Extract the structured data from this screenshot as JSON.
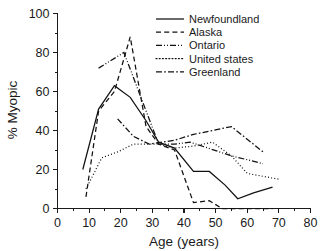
{
  "chart_data": {
    "type": "line",
    "title": "",
    "xlabel": "Age (years)",
    "ylabel": "% Myopic",
    "xlim": [
      0,
      80
    ],
    "ylim": [
      0,
      100
    ],
    "xticks": [
      0,
      10,
      20,
      30,
      40,
      50,
      60,
      70,
      80
    ],
    "yticks": [
      0,
      20,
      40,
      60,
      80,
      100
    ],
    "xticks_minor": [
      5,
      15,
      25,
      35,
      45,
      55,
      65,
      75
    ],
    "yticks_minor": [
      10,
      30,
      50,
      70,
      90
    ],
    "grid": false,
    "legend_position": "top-right",
    "series": [
      {
        "name": "Newfoundland",
        "style": "solid",
        "x": [
          8,
          13,
          18,
          23,
          28,
          32,
          37,
          43,
          48,
          53,
          57,
          62,
          68
        ],
        "values": [
          20,
          51,
          63,
          57,
          45,
          34,
          31,
          19,
          19,
          12,
          5,
          8,
          11
        ]
      },
      {
        "name": "Alaska",
        "style": "dashed",
        "x": [
          9,
          13,
          18,
          23,
          28,
          32,
          37,
          43,
          48,
          52,
          68
        ],
        "values": [
          6,
          50,
          60,
          88,
          42,
          33,
          30,
          3,
          4,
          0,
          0
        ]
      },
      {
        "name": "Ontario",
        "style": "dash-dot-dot",
        "x": [
          13,
          21,
          32,
          37,
          42,
          55,
          65
        ],
        "values": [
          72,
          80,
          33,
          33,
          34,
          27,
          23
        ]
      },
      {
        "name": "United states",
        "style": "dotted",
        "x": [
          9,
          14,
          19,
          24,
          32,
          37,
          43,
          49,
          55,
          60,
          70
        ],
        "values": [
          10,
          26,
          29,
          33,
          33,
          31,
          32,
          34,
          27,
          18,
          15
        ]
      },
      {
        "name": "Greenland",
        "style": "dash-dot",
        "x": [
          19,
          24,
          29,
          37,
          43,
          49,
          55,
          65
        ],
        "values": [
          46,
          37,
          33,
          35,
          38,
          40,
          42,
          29
        ]
      }
    ]
  },
  "axes": {
    "x_title": "Age (years)",
    "y_title": "% Myopic",
    "x_tick_labels": [
      "0",
      "10",
      "20",
      "30",
      "40",
      "50",
      "60",
      "70",
      "80"
    ],
    "y_tick_labels": [
      "0",
      "20",
      "40",
      "60",
      "80",
      "100"
    ]
  },
  "legend": {
    "entries": [
      {
        "label": "Newfoundland",
        "style": "solid"
      },
      {
        "label": "Alaska",
        "style": "dashed"
      },
      {
        "label": "Ontario",
        "style": "dash-dot-dot"
      },
      {
        "label": "United states",
        "style": "dotted"
      },
      {
        "label": "Greenland",
        "style": "dash-dot"
      }
    ]
  },
  "colors": {
    "ink": "#111111",
    "background": "#ffffff"
  }
}
